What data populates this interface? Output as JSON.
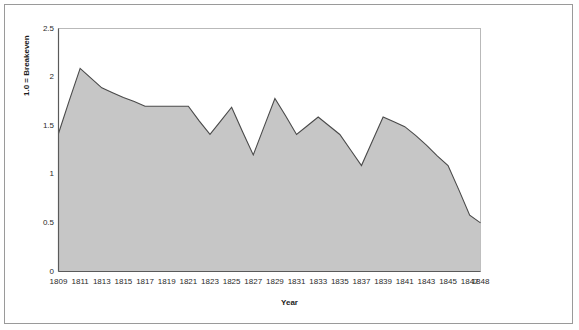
{
  "chart_data": {
    "type": "area",
    "title": "",
    "xlabel": "Year",
    "ylabel": "1.0 = Breakeven",
    "xlim": [
      1809,
      1848
    ],
    "ylim": [
      0,
      2.5
    ],
    "ytick_values": [
      0,
      0.5,
      1,
      1.5,
      2,
      2.5
    ],
    "ytick_labels": [
      "0",
      "0.5",
      "1",
      "1.5",
      "2",
      "2.5"
    ],
    "xtick_labels": [
      "1809",
      "1811",
      "1813",
      "1815",
      "1817",
      "1819",
      "1821",
      "1823",
      "1825",
      "1827",
      "1829",
      "1831",
      "1833",
      "1835",
      "1837",
      "1839",
      "1841",
      "1843",
      "1845",
      "1847",
      "1848"
    ],
    "grid": false,
    "legend": "none",
    "series_fill_color": "#c6c6c6",
    "series_line_color": "#4a4a4a",
    "x": [
      1809,
      1810,
      1811,
      1812,
      1813,
      1814,
      1815,
      1816,
      1817,
      1818,
      1819,
      1820,
      1821,
      1822,
      1823,
      1824,
      1825,
      1826,
      1827,
      1828,
      1829,
      1830,
      1831,
      1832,
      1833,
      1834,
      1835,
      1836,
      1837,
      1838,
      1839,
      1840,
      1841,
      1842,
      1843,
      1844,
      1845,
      1846,
      1847,
      1848
    ],
    "values": [
      1.42,
      1.76,
      2.09,
      1.99,
      1.89,
      1.84,
      1.79,
      1.75,
      1.7,
      1.7,
      1.7,
      1.7,
      1.7,
      1.55,
      1.41,
      1.55,
      1.69,
      1.44,
      1.2,
      1.49,
      1.78,
      1.6,
      1.41,
      1.5,
      1.59,
      1.5,
      1.41,
      1.25,
      1.09,
      1.34,
      1.59,
      1.54,
      1.49,
      1.4,
      1.3,
      1.19,
      1.09,
      0.84,
      0.58,
      0.5
    ]
  }
}
